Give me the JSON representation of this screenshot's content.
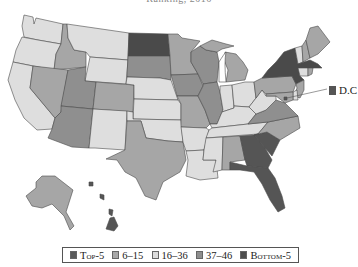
{
  "title": "Ranking, 2016",
  "colors": {
    "top5": "#555555",
    "r6_15": "#a6a6a6",
    "r16_36": "#dedede",
    "r37_46": "#8f8f8f",
    "bottom5": "#4a4a4a",
    "stroke": "#4a4a4a"
  },
  "legend": {
    "items": [
      {
        "label": "Top-5",
        "color": "#5a5a5a"
      },
      {
        "label": "6–15",
        "color": "#a8a8a8"
      },
      {
        "label": "16–36",
        "color": "#dcdcdc"
      },
      {
        "label": "37–46",
        "color": "#8e8e8e"
      },
      {
        "label": "Bottom-5",
        "color": "#4d4d4d"
      }
    ]
  },
  "annotations": {
    "dc_label": "D.C"
  },
  "states": {
    "WA": "16–36",
    "OR": "16–36",
    "CA": "16–36",
    "ID": "6–15",
    "NV": "6–15",
    "MT": "16–36",
    "WY": "16–36",
    "UT": "37–46",
    "AZ": "37–46",
    "CO": "6–15",
    "NM": "16–36",
    "ND": "Bottom-5",
    "SD": "37–46",
    "NE": "16–36",
    "KS": "16–36",
    "OK": "16–36",
    "TX": "6–15",
    "MN": "6–15",
    "IA": "37–46",
    "MO": "6–15",
    "AR": "16–36",
    "LA": "16–36",
    "WI": "37–46",
    "IL": "37–46",
    "MI": "6–15",
    "IN": "16–36",
    "OH": "16–36",
    "KY": "16–36",
    "TN": "16–36",
    "MS": "16–36",
    "AL": "6–15",
    "GA": "Top-5",
    "FL": "Top-5",
    "SC": "Top-5",
    "NC": "6–15",
    "VA": "37–46",
    "WV": "16–36",
    "PA": "6–15",
    "NY": "Bottom-5",
    "VT": "16–36",
    "NH": "6–15",
    "ME": "6–15",
    "MA": "Bottom-5",
    "CT": "16–36",
    "RI": "6–15",
    "NJ": "6–15",
    "DE": "16–36",
    "MD": "6–15",
    "DC": "Top-5",
    "AK": "6–15",
    "HI": "Top-5"
  }
}
